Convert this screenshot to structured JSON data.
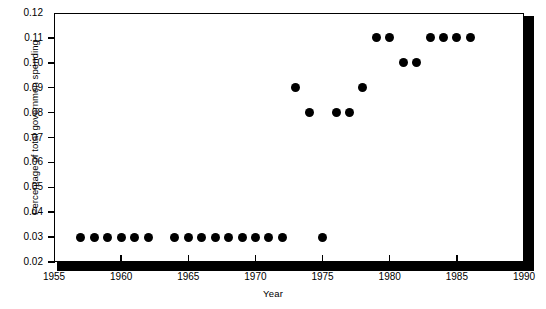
{
  "chart_data": {
    "type": "scatter",
    "title": "",
    "xlabel": "Year",
    "ylabel": "Percentage of total governmen spending",
    "xlim": [
      1955,
      1990
    ],
    "ylim": [
      0.02,
      0.12
    ],
    "xticks": [
      1955,
      1960,
      1965,
      1970,
      1975,
      1980,
      1985,
      1990
    ],
    "xtick_labels": [
      "1955",
      "1960",
      "1965",
      "1970",
      "1975",
      "1980",
      "1985",
      "1990"
    ],
    "yticks": [
      0.02,
      0.03,
      0.04,
      0.05,
      0.06,
      0.07,
      0.08,
      0.09,
      0.1,
      0.11,
      0.12
    ],
    "ytick_labels": [
      "0.02",
      "0.03",
      "0.04",
      "0.05",
      "0.06",
      "0.07",
      "0.08",
      "0.09",
      "0.10",
      "0.11",
      "0.12"
    ],
    "grid": false,
    "legend": null,
    "marker": "filled-circle",
    "marker_color": "#000000",
    "x": [
      1957,
      1958,
      1959,
      1960,
      1961,
      1962,
      1964,
      1965,
      1966,
      1967,
      1968,
      1969,
      1970,
      1971,
      1972,
      1973,
      1974,
      1975,
      1976,
      1977,
      1978,
      1979,
      1980,
      1981,
      1982,
      1983,
      1984,
      1985,
      1986
    ],
    "values": [
      0.03,
      0.03,
      0.03,
      0.03,
      0.03,
      0.03,
      0.03,
      0.03,
      0.03,
      0.03,
      0.03,
      0.03,
      0.03,
      0.03,
      0.03,
      0.09,
      0.08,
      0.03,
      0.08,
      0.08,
      0.09,
      0.11,
      0.11,
      0.1,
      0.1,
      0.11,
      0.11,
      0.11,
      0.11
    ]
  },
  "axes": {
    "y_title": "Percentage of total governmen spending",
    "x_title": "Year"
  }
}
